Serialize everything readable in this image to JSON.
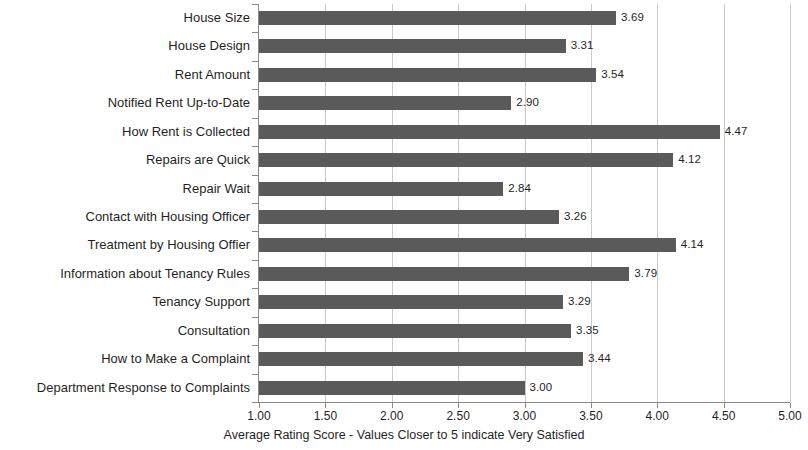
{
  "chart_data": {
    "type": "bar",
    "orientation": "horizontal",
    "title": "",
    "xlabel": "Average Rating Score - Values Closer to 5 indicate Very Satisfied",
    "ylabel": "",
    "xlim": [
      1.0,
      5.0
    ],
    "xticks": [
      "1.00",
      "1.50",
      "2.00",
      "2.50",
      "3.00",
      "3.50",
      "4.00",
      "4.50",
      "5.00"
    ],
    "xtick_values": [
      1.0,
      1.5,
      2.0,
      2.5,
      3.0,
      3.5,
      4.0,
      4.5,
      5.0
    ],
    "grid": true,
    "grid_axis": "x",
    "legend": false,
    "bar_color": "#5a5a5a",
    "categories": [
      "House Size",
      "House Design",
      "Rent Amount",
      "Notified Rent Up-to-Date",
      "How Rent is Collected",
      "Repairs are Quick",
      "Repair Wait",
      "Contact with Housing Officer",
      "Treatment by Housing Offier",
      "Information about Tenancy Rules",
      "Tenancy Support",
      "Consultation",
      "How to Make a Complaint",
      "Department Response to Complaints"
    ],
    "values": [
      3.69,
      3.31,
      3.54,
      2.9,
      4.47,
      4.12,
      2.84,
      3.26,
      4.14,
      3.79,
      3.29,
      3.35,
      3.44,
      3.0
    ],
    "value_labels": [
      "3.69",
      "3.31",
      "3.54",
      "2.90",
      "4.47",
      "4.12",
      "2.84",
      "3.26",
      "4.14",
      "3.79",
      "3.29",
      "3.35",
      "3.44",
      "3.00"
    ]
  }
}
